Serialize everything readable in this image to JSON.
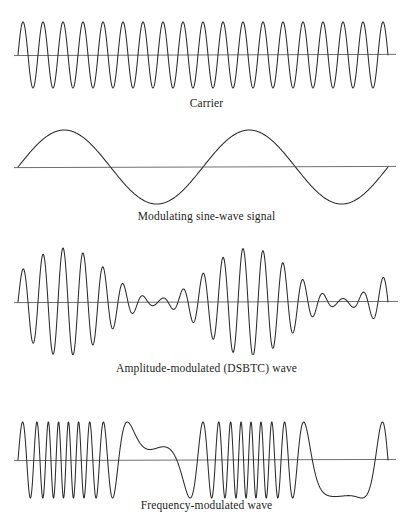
{
  "figure": {
    "background_color": "#ffffff",
    "wave_color": "#2b2b2b",
    "axis_color": "#6f6f6f",
    "width": 413,
    "height": 517
  },
  "panels": [
    {
      "id": "carrier",
      "caption": "Carrier",
      "wave_top": 14,
      "wave_height": 80,
      "caption_top": 96,
      "plot": {
        "x_start": 18,
        "x_end": 388,
        "axis_x_end": 396,
        "baseline_ratio": 0.512,
        "amplitude": 33
      },
      "chart": {
        "type": "line",
        "kind": "carrier-sine",
        "cycles": 18.5,
        "amplitude": 1.0,
        "phase": 0.0
      }
    },
    {
      "id": "modulating-signal",
      "caption": "Modulating sine-wave signal",
      "wave_top": 122,
      "wave_height": 84,
      "caption_top": 209,
      "plot": {
        "x_start": 18,
        "x_end": 388,
        "axis_x_end": 396,
        "baseline_ratio": 0.536,
        "amplitude": 37
      },
      "chart": {
        "type": "line",
        "kind": "modulating-sine",
        "cycles": 2.0,
        "amplitude": 1.0,
        "phase": 0.0
      }
    },
    {
      "id": "amplitude-modulated",
      "caption": "Amplitude-modulated (DSBTC) wave",
      "wave_top": 243,
      "wave_height": 112,
      "caption_top": 361,
      "plot": {
        "x_start": 18,
        "x_end": 388,
        "axis_x_end": 398,
        "baseline_ratio": 0.527,
        "amplitude": 54
      },
      "chart": {
        "type": "line",
        "kind": "amplitude-modulated",
        "carrier_cycles": 18.5,
        "modulation_cycles": 2.0,
        "modulation_index": 0.88,
        "modulation_phase": 0.0
      }
    },
    {
      "id": "frequency-modulated",
      "caption": "Frequency-modulated wave",
      "wave_top": 418,
      "wave_height": 84,
      "caption_top": 498,
      "plot": {
        "x_start": 18,
        "x_end": 388,
        "axis_x_end": 396,
        "baseline_ratio": 0.5,
        "amplitude": 38
      },
      "chart": {
        "type": "line",
        "kind": "frequency-modulated",
        "carrier_cycles": 18.5,
        "modulation_cycles": 2.0,
        "modulation_index": 9.5,
        "modulation_phase": 0.0
      }
    }
  ],
  "chart_data": {
    "type": "line",
    "xlabel": "",
    "ylabel": "",
    "grid": false,
    "legend": "none",
    "series": [
      {
        "name": "Carrier",
        "kind": "carrier-sine",
        "cycles": 18.5,
        "amplitude": 1.0,
        "description": "Constant-amplitude, constant-frequency sinusoid"
      },
      {
        "name": "Modulating sine-wave signal",
        "kind": "modulating-sine",
        "cycles": 2.0,
        "amplitude": 1.0,
        "description": "Low-frequency message sinusoid, two full cycles"
      },
      {
        "name": "Amplitude-modulated (DSBTC) wave",
        "kind": "amplitude-modulated",
        "carrier_cycles": 18.5,
        "modulation_cycles": 2.0,
        "modulation_index": 0.88,
        "description": "Carrier whose envelope follows the modulating sine wave"
      },
      {
        "name": "Frequency-modulated wave",
        "kind": "frequency-modulated",
        "carrier_cycles": 18.5,
        "modulation_cycles": 2.0,
        "modulation_index": 9.5,
        "description": "Constant amplitude; instantaneous frequency follows the modulating sine wave"
      }
    ]
  }
}
